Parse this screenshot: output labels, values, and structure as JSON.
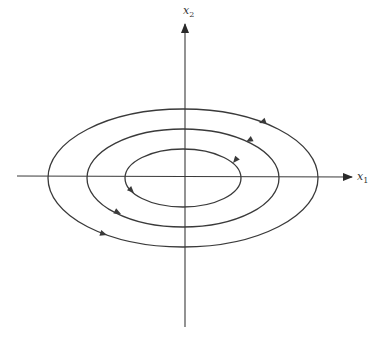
{
  "diagram": {
    "type": "phase-portrait",
    "colors": {
      "curve": "#3a3a3a",
      "axis": "#3a3a3a",
      "background": "#ffffff"
    },
    "axes": {
      "x": {
        "label": "x",
        "subscript": "1"
      },
      "y": {
        "label": "x",
        "subscript": "2"
      }
    },
    "orbits": [
      {
        "name": "inner",
        "rx": 58,
        "ry": 29
      },
      {
        "name": "middle",
        "rx": 96,
        "ry": 49
      },
      {
        "name": "outer",
        "rx": 135,
        "ry": 69
      }
    ],
    "direction": "counterclockwise"
  }
}
